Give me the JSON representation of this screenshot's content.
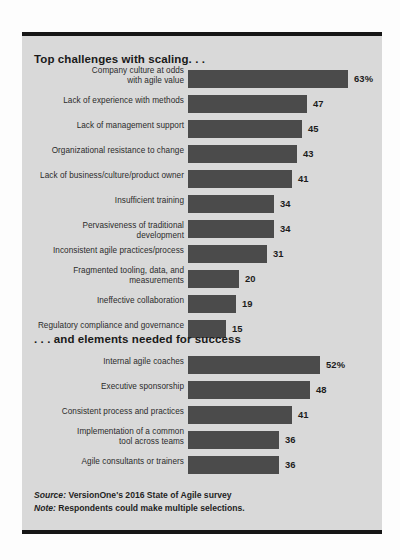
{
  "chart_data": [
    {
      "type": "bar",
      "orientation": "horizontal",
      "title": "Top challenges with scaling...",
      "xlabel": "",
      "ylabel": "",
      "xlim": [
        0,
        63
      ],
      "grid": false,
      "legend": "none",
      "unit": "percent",
      "categories": [
        "Company culture at odds with agile value",
        "Lack of experience with methods",
        "Lack of management support",
        "Organizational resistance to change",
        "Lack of business/culture/product owner",
        "Insufficient training",
        "Pervasiveness of traditional development",
        "Inconsistent agile practices/process",
        "Fragmented tooling, data, and measurements",
        "Ineffective collaboration",
        "Regulatory compliance and governance"
      ],
      "values": [
        63,
        47,
        45,
        43,
        41,
        34,
        34,
        31,
        20,
        19,
        15
      ],
      "value_labels": [
        "63%",
        "47",
        "45",
        "43",
        "41",
        "34",
        "34",
        "31",
        "20",
        "19",
        "15"
      ]
    },
    {
      "type": "bar",
      "orientation": "horizontal",
      "title": "... and elements needed for success",
      "xlabel": "",
      "ylabel": "",
      "xlim": [
        0,
        63
      ],
      "grid": false,
      "legend": "none",
      "unit": "percent",
      "categories": [
        "Internal agile coaches",
        "Executive sponsorship",
        "Consistent process and practices",
        "Implementation of a common tool across teams",
        "Agile consultants or trainers"
      ],
      "values": [
        52,
        48,
        41,
        36,
        36
      ],
      "value_labels": [
        "52%",
        "48",
        "41",
        "36",
        "36"
      ]
    }
  ],
  "sections": [
    {
      "heading": "Top challenges with scaling. . .",
      "rows": [
        {
          "label_lines": [
            "Company culture at odds",
            "with agile value"
          ],
          "value": 63,
          "value_label": "63%"
        },
        {
          "label_lines": [
            "Lack of experience with methods"
          ],
          "value": 47,
          "value_label": "47"
        },
        {
          "label_lines": [
            "Lack of management support"
          ],
          "value": 45,
          "value_label": "45"
        },
        {
          "label_lines": [
            "Organizational resistance to change"
          ],
          "value": 43,
          "value_label": "43"
        },
        {
          "label_lines": [
            "Lack of business/culture/product owner"
          ],
          "value": 41,
          "value_label": "41"
        },
        {
          "label_lines": [
            "Insufficient training"
          ],
          "value": 34,
          "value_label": "34"
        },
        {
          "label_lines": [
            "Pervasiveness of traditional development"
          ],
          "value": 34,
          "value_label": "34"
        },
        {
          "label_lines": [
            "Inconsistent agile practices/process"
          ],
          "value": 31,
          "value_label": "31"
        },
        {
          "label_lines": [
            "Fragmented tooling, data, and",
            "measurements"
          ],
          "value": 20,
          "value_label": "20"
        },
        {
          "label_lines": [
            "Ineffective collaboration"
          ],
          "value": 19,
          "value_label": "19"
        },
        {
          "label_lines": [
            "Regulatory compliance and governance"
          ],
          "value": 15,
          "value_label": "15"
        }
      ]
    },
    {
      "heading": ". . . and elements needed for success",
      "rows": [
        {
          "label_lines": [
            "Internal agile coaches"
          ],
          "value": 52,
          "value_label": "52%"
        },
        {
          "label_lines": [
            "Executive sponsorship"
          ],
          "value": 48,
          "value_label": "48"
        },
        {
          "label_lines": [
            "Consistent process and practices"
          ],
          "value": 41,
          "value_label": "41"
        },
        {
          "label_lines": [
            "Implementation of a common",
            "tool across teams"
          ],
          "value": 36,
          "value_label": "36"
        },
        {
          "label_lines": [
            "Agile consultants or trainers"
          ],
          "value": 36,
          "value_label": "36"
        }
      ]
    }
  ],
  "footer": {
    "source_lead": "Source:",
    "source_text": "VersionOne's 2016 State of Agile survey",
    "note_lead": "Note:",
    "note_text": "Respondents could make multiple selections."
  },
  "style": {
    "bar_color": "#4b4b4b",
    "card_background": "#d9d9d9",
    "rule_color": "#161616",
    "text_color": "#1f1f1f",
    "page_background": "#fdfdfd"
  },
  "scale": {
    "max_value": 63,
    "bar_track_px": 160
  }
}
